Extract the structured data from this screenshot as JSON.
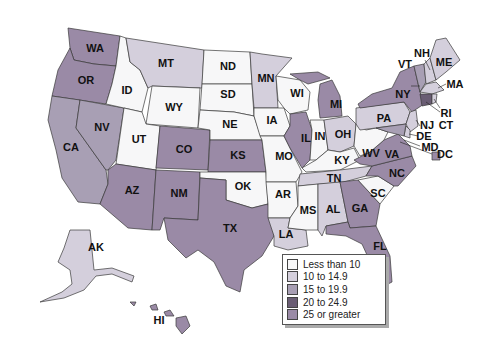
{
  "legend": {
    "classes": [
      {
        "label": "Less than 10",
        "color": "#f7f7f8"
      },
      {
        "label": "10 to 14.9",
        "color": "#d4cfdc"
      },
      {
        "label": "15 to 19.9",
        "color": "#a89fb4"
      },
      {
        "label": "20 to 24.9",
        "color": "#6a5d74"
      },
      {
        "label": "25 or greater",
        "color": "#9a8aa6"
      }
    ]
  },
  "states": {
    "WA": "WA",
    "OR": "OR",
    "CA": "CA",
    "NV": "NV",
    "ID": "ID",
    "MT": "MT",
    "WY": "WY",
    "UT": "UT",
    "CO": "CO",
    "AZ": "AZ",
    "NM": "NM",
    "ND": "ND",
    "SD": "SD",
    "NE": "NE",
    "KS": "KS",
    "OK": "OK",
    "TX": "TX",
    "MN": "MN",
    "IA": "IA",
    "MO": "MO",
    "AR": "AR",
    "LA": "LA",
    "WI": "WI",
    "IL": "IL",
    "MI": "MI",
    "IN": "IN",
    "OH": "OH",
    "KY": "KY",
    "TN": "TN",
    "MS": "MS",
    "AL": "AL",
    "GA": "GA",
    "FL": "FL",
    "SC": "SC",
    "NC": "NC",
    "VA": "VA",
    "WV": "WV",
    "PA": "PA",
    "NY": "NY",
    "VT": "VT",
    "NH": "NH",
    "ME": "ME",
    "MA": "MA",
    "RI": "RI",
    "CT": "CT",
    "NJ": "NJ",
    "DE": "DE",
    "MD": "MD",
    "DC": "DC",
    "AK": "AK",
    "HI": "HI"
  }
}
